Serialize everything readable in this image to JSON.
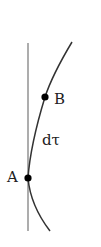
{
  "diagram": {
    "type": "worldline",
    "points": [
      {
        "id": "A",
        "label": "A",
        "x": 28,
        "y": 178
      },
      {
        "id": "B",
        "label": "B",
        "x": 45,
        "y": 97
      }
    ],
    "segment_label": "dτ",
    "colors": {
      "axis": "#8a8a8a",
      "curve": "#333333",
      "point": "#000000",
      "text": "#222222"
    }
  }
}
